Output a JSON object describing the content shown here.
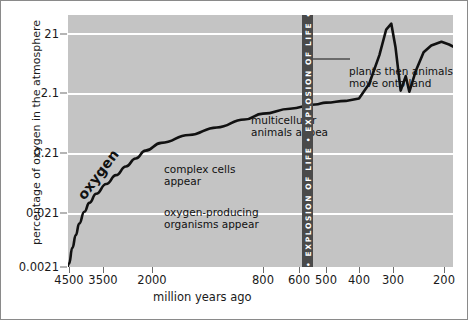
{
  "chart_data": {
    "type": "line",
    "title": "",
    "xlabel": "million years ago",
    "ylabel": "percentage of oxygen in the atmosphere",
    "x_ticks": [
      4500,
      3500,
      2000,
      800,
      600,
      500,
      400,
      300,
      200
    ],
    "x_tick_labels": [
      "4500",
      "3500",
      "2000",
      "800",
      "600",
      "500",
      "400",
      "300",
      "200"
    ],
    "y_ticks": [
      21,
      2.1,
      0.21,
      0.021,
      0.0021
    ],
    "y_tick_labels": [
      "21",
      "2.1",
      "0.21",
      "0.021",
      "0.0021"
    ],
    "y_scale": "log",
    "ylim": [
      0.0021,
      40
    ],
    "xlim": [
      4700,
      150
    ],
    "x_axis_direction": "reversed",
    "grid": "horizontal",
    "legend": "none",
    "plot_background": "#c4c4c4",
    "gridline_color": "#ffffff",
    "line_color": "#111111",
    "series": [
      {
        "name": "oxygen",
        "points": [
          [
            4600,
            0.0021
          ],
          [
            4500,
            0.003
          ],
          [
            4400,
            0.0055
          ],
          [
            4300,
            0.009
          ],
          [
            4200,
            0.014
          ],
          [
            4050,
            0.022
          ],
          [
            3900,
            0.031
          ],
          [
            3700,
            0.044
          ],
          [
            3400,
            0.064
          ],
          [
            3100,
            0.09
          ],
          [
            2800,
            0.125
          ],
          [
            2500,
            0.17
          ],
          [
            2200,
            0.23
          ],
          [
            1900,
            0.31
          ],
          [
            1600,
            0.42
          ],
          [
            1300,
            0.56
          ],
          [
            1000,
            0.76
          ],
          [
            800,
            0.95
          ],
          [
            650,
            1.15
          ],
          [
            540,
            1.35
          ],
          [
            500,
            1.45
          ],
          [
            440,
            1.55
          ],
          [
            400,
            1.7
          ],
          [
            370,
            3.0
          ],
          [
            340,
            9.0
          ],
          [
            320,
            24.0
          ],
          [
            305,
            30.0
          ],
          [
            295,
            12.0
          ],
          [
            285,
            2.3
          ],
          [
            275,
            4.0
          ],
          [
            268,
            2.2
          ],
          [
            255,
            5.0
          ],
          [
            240,
            10.0
          ],
          [
            225,
            13.0
          ],
          [
            205,
            15.0
          ],
          [
            190,
            13.5
          ],
          [
            170,
            11.0
          ],
          [
            155,
            10.5
          ]
        ]
      }
    ],
    "annotations": [
      {
        "id": "oxygen",
        "text": "oxygen",
        "rotated": true
      },
      {
        "id": "oxygen_producing",
        "text": "oxygen-producing\norganisms appear"
      },
      {
        "id": "complex_cells",
        "text": "complex cells\nappear"
      },
      {
        "id": "multicellular",
        "text": "multicellular\nanimals appea"
      },
      {
        "id": "plants",
        "text": "plants then animals\nmove onto land"
      },
      {
        "id": "explosion",
        "text": "• EXPLOSION OF LIFE • EXPLOSION OF LIFE •",
        "orientation": "vertical",
        "color": "#4a4a4a"
      }
    ]
  },
  "axes": {
    "y_title": "percentage of oxygen in the atmosphere",
    "x_title": "million years ago",
    "y_tick_labels": [
      "21",
      "2.1",
      "0.21",
      "0.021",
      "0.0021"
    ],
    "x_tick_labels": [
      "4500",
      "3500",
      "2000",
      "800",
      "600",
      "500",
      "400",
      "300",
      "200"
    ]
  },
  "annotations": {
    "oxygen": "oxygen",
    "oxygen_producing": "oxygen-producing\norganisms appear",
    "complex_cells": "complex cells\nappear",
    "multicellular": "multicellular\nanimals appea",
    "plants": "plants then animals\nmove onto land",
    "explosion_of_life": "• EXPLOSION OF LIFE • EXPLOSION OF LIFE •"
  }
}
